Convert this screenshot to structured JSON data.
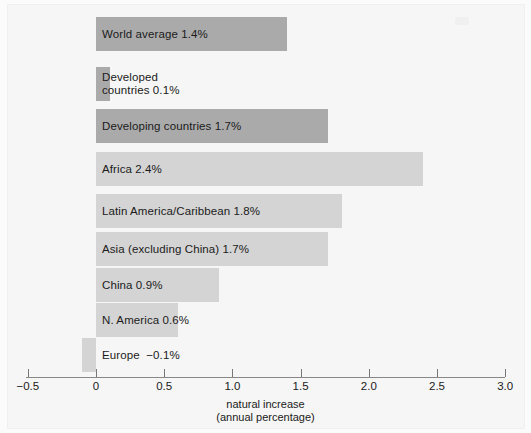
{
  "chart_data": {
    "type": "bar",
    "orientation": "horizontal",
    "title": "",
    "xlabel": "natural increase\n(annual percentage)",
    "xlabel_line1": "natural increase",
    "xlabel_line2": "(annual percentage)",
    "ylabel": "",
    "xlim": [
      -0.5,
      3.0
    ],
    "xticks": [
      -0.5,
      0,
      0.5,
      1.0,
      1.5,
      2.0,
      2.5,
      3.0
    ],
    "xtick_labels": [
      "−0.5",
      "0",
      "0.5",
      "1.0",
      "1.5",
      "2.0",
      "2.5",
      "3.0"
    ],
    "grid": false,
    "legend": "none",
    "categories": [
      "World average",
      "Developed countries",
      "Developing countries",
      "Africa",
      "Latin America/Caribbean",
      "Asia (excluding China)",
      "China",
      "N. America",
      "Europe"
    ],
    "values": [
      1.4,
      0.1,
      1.7,
      2.4,
      1.8,
      1.7,
      0.9,
      0.6,
      -0.1
    ],
    "bars": [
      {
        "label": "World average 1.4%",
        "category": "World average",
        "value": 1.4,
        "value_text": "1.4%",
        "shade": "dark",
        "label_lines": [
          "World average 1.4%"
        ]
      },
      {
        "label": "Developed countries 0.1%",
        "category": "Developed countries",
        "value": 0.1,
        "value_text": "0.1%",
        "shade": "dark",
        "label_lines": [
          "Developed",
          "countries 0.1%"
        ]
      },
      {
        "label": "Developing countries 1.7%",
        "category": "Developing countries",
        "value": 1.7,
        "value_text": "1.7%",
        "shade": "dark",
        "label_lines": [
          "Developing countries 1.7%"
        ]
      },
      {
        "label": "Africa 2.4%",
        "category": "Africa",
        "value": 2.4,
        "value_text": "2.4%",
        "shade": "light",
        "label_lines": [
          "Africa 2.4%"
        ]
      },
      {
        "label": "Latin America/Caribbean 1.8%",
        "category": "Latin America/Caribbean",
        "value": 1.8,
        "value_text": "1.8%",
        "shade": "light",
        "label_lines": [
          "Latin America/Caribbean 1.8%"
        ]
      },
      {
        "label": "Asia (excluding China) 1.7%",
        "category": "Asia (excluding China)",
        "value": 1.7,
        "value_text": "1.7%",
        "shade": "light",
        "label_lines": [
          "Asia (excluding China) 1.7%"
        ]
      },
      {
        "label": "China 0.9%",
        "category": "China",
        "value": 0.9,
        "value_text": "0.9%",
        "shade": "light",
        "label_lines": [
          "China 0.9%"
        ]
      },
      {
        "label": "N. America 0.6%",
        "category": "N. America",
        "value": 0.6,
        "value_text": "0.6%",
        "shade": "light",
        "label_lines": [
          "N. America 0.6%"
        ]
      },
      {
        "label": "Europe −0.1%",
        "category": "Europe",
        "value": -0.1,
        "value_text": "−0.1%",
        "shade": "light",
        "label_lines": [
          "Europe  −0.1%"
        ]
      }
    ],
    "colors": {
      "bar_dark": "#aaaaaa",
      "bar_light": "#d4d4d4",
      "background": "#f6f6f6",
      "axis": "#777777",
      "text": "#1b1b1b"
    }
  },
  "geometry": {
    "x_zero_px": 96,
    "px_per_unit": 136.4,
    "bar_height_px": 34,
    "bar_tops_px": [
      17,
      67,
      109,
      152,
      194,
      232,
      268,
      303,
      338
    ],
    "label_x_px": 102,
    "axis_y_px": 377
  }
}
